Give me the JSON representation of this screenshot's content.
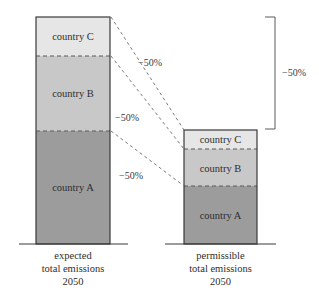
{
  "diagram": {
    "colors": {
      "country_c": "#e6e6e6",
      "country_b": "#c8c8c8",
      "country_a": "#9c9c9c",
      "outline": "#3a3a3a",
      "dash": "#7a7a7a"
    },
    "bars": [
      {
        "name": "expected",
        "caption": [
          "expected",
          "total emissions",
          "2050"
        ],
        "segments": [
          {
            "label": "country C"
          },
          {
            "label": "country B"
          },
          {
            "label": "country A"
          }
        ]
      },
      {
        "name": "permissible",
        "caption": [
          "permissible",
          "total emissions",
          "2050"
        ],
        "segments": [
          {
            "label": "country C"
          },
          {
            "label": "country B"
          },
          {
            "label": "country A"
          }
        ]
      }
    ],
    "connector_labels": [
      "−50%",
      "−50%",
      "−50%"
    ],
    "bracket_label": "−50%"
  }
}
